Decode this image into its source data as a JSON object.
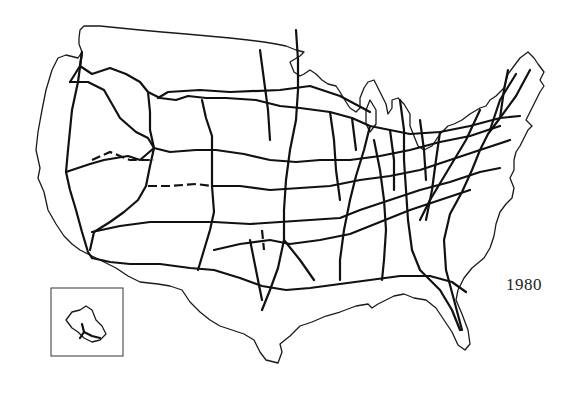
{
  "map": {
    "subject": "Interstate Highway System",
    "region": "Contiguous United States",
    "year_label": "1980",
    "inset": {
      "label": "hawaii-oahu-inset"
    },
    "colors": {
      "background": "#ffffff",
      "lines": "#111111"
    }
  }
}
